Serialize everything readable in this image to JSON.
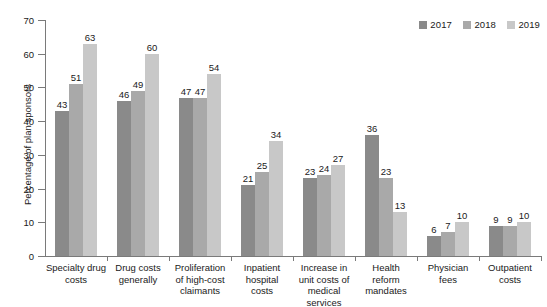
{
  "chart_data": {
    "type": "bar",
    "title": "",
    "xlabel": "",
    "ylabel": "Percentage of plan sponsors",
    "ylim": [
      0,
      70
    ],
    "ytick_step": 10,
    "yticks": [
      0,
      10,
      20,
      30,
      40,
      50,
      60,
      70
    ],
    "grid": false,
    "legend_position": "top-right",
    "categories": [
      "Specialty drug costs",
      "Drug costs generally",
      "Proliferation of high-cost claimants",
      "Inpatient hospital costs",
      "Increase in unit costs of medical services",
      "Health reform mandates",
      "Physician fees",
      "Outpatient costs"
    ],
    "category_lines": [
      [
        "Specialty drug",
        "costs"
      ],
      [
        "Drug costs",
        "generally"
      ],
      [
        "Proliferation",
        "of high-cost",
        "claimants"
      ],
      [
        "Inpatient",
        "hospital",
        "costs"
      ],
      [
        "Increase in",
        "unit costs of",
        "medical services"
      ],
      [
        "Health",
        "reform",
        "mandates"
      ],
      [
        "Physician",
        "fees"
      ],
      [
        "Outpatient",
        "costs"
      ]
    ],
    "series": [
      {
        "name": "2017",
        "color": "#8a8a8a",
        "values": [
          43,
          46,
          47,
          21,
          23,
          36,
          6,
          9
        ]
      },
      {
        "name": "2018",
        "color": "#a9a9a9",
        "values": [
          51,
          49,
          47,
          25,
          24,
          23,
          7,
          9
        ]
      },
      {
        "name": "2019",
        "color": "#c8c8c8",
        "values": [
          63,
          60,
          54,
          34,
          27,
          13,
          10,
          10
        ]
      }
    ]
  },
  "axis": {
    "y_title": "Percentage of plan sponsors"
  },
  "legend": {
    "items": [
      {
        "label": "2017",
        "color": "#8a8a8a"
      },
      {
        "label": "2018",
        "color": "#a9a9a9"
      },
      {
        "label": "2019",
        "color": "#c8c8c8"
      }
    ]
  }
}
